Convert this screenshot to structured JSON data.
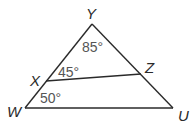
{
  "diagram": {
    "type": "triangle",
    "vertices": {
      "Y": {
        "label": "Y",
        "x": 92,
        "y": 24
      },
      "W": {
        "label": "W",
        "x": 25,
        "y": 108
      },
      "U": {
        "label": "U",
        "x": 173,
        "y": 108
      },
      "X": {
        "label": "X",
        "x": 46,
        "y": 81
      },
      "Z": {
        "label": "Z",
        "x": 141,
        "y": 74
      }
    },
    "segments": [
      "YW",
      "YU",
      "WU",
      "XZ"
    ],
    "angles": {
      "Y": {
        "text": "85°"
      },
      "YXZ": {
        "text": "45°"
      },
      "W": {
        "text": "50°"
      }
    },
    "stroke_color": "#2a2a2a",
    "angle_label_color": "#555555"
  }
}
